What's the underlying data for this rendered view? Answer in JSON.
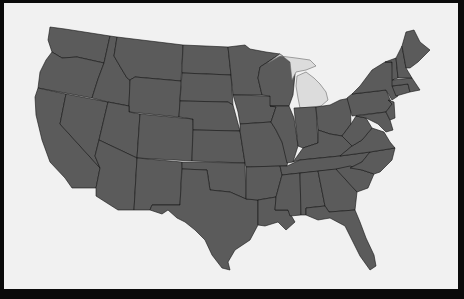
{
  "map": {
    "subject": "Contiguous United States",
    "highlighted_state": "Michigan",
    "colors": {
      "frame": "#0a0a0a",
      "background": "#f1f1f1",
      "state_fill": "#5b5b5b",
      "highlight_fill": "#dcdcdc",
      "border": "#141414"
    },
    "states": [
      {
        "name": "Washington",
        "highlighted": false,
        "points": "50,27 65,29 110,36 104,63 77,57 62,58 52,52 48,40"
      },
      {
        "name": "Oregon",
        "highlighted": false,
        "points": "52,52 62,58 77,57 104,63 98,79 92,98 38,88 40,72 46,60"
      },
      {
        "name": "California",
        "highlighted": false,
        "points": "38,88 66,94 60,124 100,168 98,178 96,188 72,188 65,178 50,162 42,140 36,115 35,97"
      },
      {
        "name": "Nevada",
        "highlighted": false,
        "points": "66,94 108,102 99,140 95,156 100,168 60,124"
      },
      {
        "name": "Idaho",
        "highlighted": false,
        "points": "104,63 110,36 117,37 114,56 121,68 127,78 130,80 129,106 108,102 92,98 98,79"
      },
      {
        "name": "Montana",
        "highlighted": false,
        "points": "117,37 183,45 181,81 135,77 130,80 127,78 121,68 114,56"
      },
      {
        "name": "Wyoming",
        "highlighted": false,
        "points": "135,77 181,81 179,117 129,112 129,106 130,80"
      },
      {
        "name": "Utah",
        "highlighted": false,
        "points": "108,102 129,106 129,112 140,114 137,158 99,140"
      },
      {
        "name": "Arizona",
        "highlighted": false,
        "points": "99,140 137,158 134,210 118,210 96,196 96,188 98,178 100,168 95,156"
      },
      {
        "name": "Colorado",
        "highlighted": false,
        "points": "140,114 193,119 192,161 137,158"
      },
      {
        "name": "New Mexico",
        "highlighted": false,
        "points": "137,158 182,162 180,205 152,205 150,210 134,210"
      },
      {
        "name": "North Dakota",
        "highlighted": false,
        "points": "183,45 228,47 231,75 182,73"
      },
      {
        "name": "South Dakota",
        "highlighted": false,
        "points": "182,73 231,75 233,105 228,102 180,101"
      },
      {
        "name": "Nebraska",
        "highlighted": false,
        "points": "180,101 228,102 233,105 240,131 193,130 193,119 179,117"
      },
      {
        "name": "Kansas",
        "highlighted": false,
        "points": "193,130 240,131 245,163 192,161"
      },
      {
        "name": "Oklahoma",
        "highlighted": false,
        "points": "182,162 245,163 246,199 230,192 210,190 207,170 182,169"
      },
      {
        "name": "Texas",
        "highlighted": false,
        "points": "207,170 210,190 230,192 246,199 258,200 258,225 250,240 235,250 228,262 230,270 222,268 212,255 205,240 195,230 185,222 177,218 168,210 162,214 150,210 152,205 180,205 182,169"
      },
      {
        "name": "Minnesota",
        "highlighted": false,
        "points": "228,47 245,45 250,49 266,52 280,54 260,67 258,78 262,95 233,95 231,75"
      },
      {
        "name": "Iowa",
        "highlighted": false,
        "points": "233,95 270,96 276,107 271,122 240,124 238,112"
      },
      {
        "name": "Missouri",
        "highlighted": false,
        "points": "240,124 271,122 276,130 282,142 289,153 287,166 246,167 245,163 240,131"
      },
      {
        "name": "Arkansas",
        "highlighted": false,
        "points": "246,167 280,166 282,175 276,197 258,200 246,199"
      },
      {
        "name": "Louisiana",
        "highlighted": false,
        "points": "258,200 276,197 275,210 288,210 295,222 286,230 278,222 265,226 258,225"
      },
      {
        "name": "Wisconsin",
        "highlighted": false,
        "points": "258,78 260,67 280,54 290,62 295,74 293,95 289,106 270,106 270,96 262,95"
      },
      {
        "name": "Illinois",
        "highlighted": false,
        "points": "270,106 289,106 294,118 298,146 293,162 287,163 282,142 276,130 271,122 276,107"
      },
      {
        "name": "Michigan-UP",
        "highlighted": true,
        "points": "268,63 280,56 296,58 310,60 316,66 306,70 296,72 292,80 290,62 280,54"
      },
      {
        "name": "Michigan-LP",
        "highlighted": true,
        "points": "297,76 306,72 314,78 320,84 326,92 328,100 321,106 300,108 298,98 296,86"
      },
      {
        "name": "Indiana",
        "highlighted": false,
        "points": "294,108 316,107 318,143 303,148 298,146"
      },
      {
        "name": "Ohio",
        "highlighted": false,
        "points": "316,107 330,105 340,100 350,98 351,124 342,136 330,134 318,130"
      },
      {
        "name": "Kentucky",
        "highlighted": false,
        "points": "293,162 303,148 318,143 318,130 330,134 342,136 352,146 340,156 300,160"
      },
      {
        "name": "Tennessee",
        "highlighted": false,
        "points": "287,166 300,160 340,156 370,152 362,162 350,168 282,175 280,166"
      },
      {
        "name": "Mississippi",
        "highlighted": false,
        "points": "282,175 300,173 301,215 290,216 288,210 275,210 276,197"
      },
      {
        "name": "Alabama",
        "highlighted": false,
        "points": "300,173 318,171 325,206 306,208 306,215 301,215"
      },
      {
        "name": "Georgia",
        "highlighted": false,
        "points": "318,171 336,169 346,180 357,192 355,210 329,212 325,206"
      },
      {
        "name": "Florida",
        "highlighted": false,
        "points": "306,208 325,206 329,212 355,210 360,222 366,238 374,255 376,266 370,270 360,256 352,240 345,226 330,218 318,220 306,215"
      },
      {
        "name": "South Carolina",
        "highlighted": false,
        "points": "336,169 350,166 362,170 374,174 368,188 357,192 346,180"
      },
      {
        "name": "North Carolina",
        "highlighted": false,
        "points": "350,168 362,162 370,152 395,148 392,160 380,172 374,174 362,170"
      },
      {
        "name": "Virginia",
        "highlighted": false,
        "points": "340,156 352,146 362,140 372,128 384,132 390,142 395,148 370,152"
      },
      {
        "name": "West Virginia",
        "highlighted": false,
        "points": "342,136 351,124 356,116 366,118 372,128 362,140 352,146"
      },
      {
        "name": "Pennsylvania",
        "highlighted": false,
        "points": "347,98 352,94 386,90 392,104 386,112 352,116"
      },
      {
        "name": "New York",
        "highlighted": false,
        "points": "352,94 360,86 372,70 385,62 392,62 394,86 398,96 392,100 386,90"
      },
      {
        "name": "Maryland-Delaware",
        "highlighted": false,
        "points": "356,116 386,112 390,120 393,130 386,132 378,124 366,118"
      },
      {
        "name": "New Jersey",
        "highlighted": false,
        "points": "388,100 394,102 395,118 390,120 386,112 392,104"
      },
      {
        "name": "Connecticut-RI",
        "highlighted": false,
        "points": "392,86 408,84 410,92 396,96"
      },
      {
        "name": "Massachusetts",
        "highlighted": false,
        "points": "392,80 412,78 416,84 420,90 410,92 408,84 392,86"
      },
      {
        "name": "Vermont",
        "highlighted": false,
        "points": "385,62 396,58 398,78 392,80 392,62"
      },
      {
        "name": "New Hampshire",
        "highlighted": false,
        "points": "396,58 402,46 406,68 412,78 398,78"
      },
      {
        "name": "Maine",
        "highlighted": false,
        "points": "402,46 406,32 414,30 420,42 430,50 418,62 410,68 406,68"
      }
    ]
  }
}
